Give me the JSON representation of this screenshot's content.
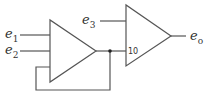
{
  "diagram": {
    "inputs": [
      {
        "base": "e",
        "sub": "1"
      },
      {
        "base": "e",
        "sub": "2"
      },
      {
        "base": "e",
        "sub": "3"
      }
    ],
    "output": {
      "base": "e",
      "sub": "o"
    },
    "amplifier2_gain_label": "10",
    "colors": {
      "line": "#555555",
      "text": "#333333"
    }
  }
}
